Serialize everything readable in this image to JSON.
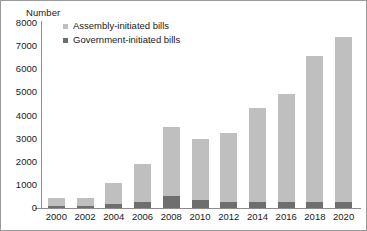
{
  "chart_data": {
    "type": "bar",
    "subtype": "stacked-bar",
    "title": "",
    "ylabel": "Number",
    "xlabel": "",
    "ylim": [
      0,
      8000
    ],
    "yticks": [
      8000,
      7000,
      6000,
      5000,
      4000,
      3000,
      2000,
      1000,
      0
    ],
    "ytick_labels": [
      "8000",
      "7000",
      "6000",
      "5000",
      "4000",
      "3000",
      "2000",
      "1000",
      "0"
    ],
    "grid": false,
    "legend_position": "upper-left-inside",
    "categories": [
      "2000",
      "2002",
      "2004",
      "2006",
      "2008",
      "2010",
      "2012",
      "2014",
      "2016",
      "2018",
      "2020"
    ],
    "series": [
      {
        "name": "Government-initiated bills",
        "color": "#6e6e6e",
        "values": [
          100,
          80,
          160,
          250,
          530,
          350,
          240,
          260,
          280,
          240,
          260
        ]
      },
      {
        "name": "Assembly-initiated bills",
        "color": "#bfbfbf",
        "values": [
          320,
          340,
          910,
          1650,
          2970,
          2640,
          3010,
          4050,
          4670,
          6340,
          7140
        ]
      }
    ],
    "totals": [
      420,
      420,
      1070,
      1900,
      3500,
      2990,
      3250,
      4310,
      4950,
      6580,
      7400
    ]
  },
  "legend": {
    "items": [
      {
        "label": "Assembly-initiated bills",
        "swatch": "assembly"
      },
      {
        "label": "Government-initiated bills",
        "swatch": "government"
      }
    ]
  },
  "colors": {
    "assembly": "#bfbfbf",
    "government": "#6e6e6e",
    "axis": "#8c8c8c",
    "frame": "#9a9a9a",
    "text": "#1a1a1a"
  }
}
